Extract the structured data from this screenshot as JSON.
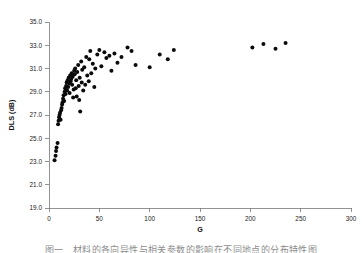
{
  "figure": {
    "caption": "图一　材料的各向异性与相关参数的影响在不同地点的分布特性图",
    "background": "#ffffff",
    "point_color": "#0b0b0b",
    "axis_color": "#777777"
  },
  "chart_data": {
    "type": "scatter",
    "title": "",
    "xlabel": "G",
    "ylabel": "DLS (dB)",
    "xlim": [
      0,
      300
    ],
    "ylim": [
      19.0,
      35.0
    ],
    "xticks": [
      0,
      50,
      100,
      150,
      200,
      250,
      300
    ],
    "xticklabels": [
      "0",
      "50",
      "100",
      "150",
      "200",
      "250",
      "300"
    ],
    "yticks": [
      19.0,
      21.0,
      23.0,
      25.0,
      27.0,
      29.0,
      31.0,
      33.0,
      35.0
    ],
    "yticklabels": [
      "19.0",
      "21.0",
      "23.0",
      "25.0",
      "27.0",
      "29.0",
      "31.0",
      "33.0",
      "35.0"
    ],
    "grid": false,
    "legend": null,
    "marker": "filled-circle",
    "marker_size": 2.0,
    "series": [
      {
        "name": "DLS vs G",
        "points": [
          [
            5.5,
            23.1
          ],
          [
            6.5,
            23.5
          ],
          [
            7.0,
            23.9
          ],
          [
            7.5,
            24.2
          ],
          [
            8.5,
            24.6
          ],
          [
            9.0,
            26.2
          ],
          [
            9.5,
            26.5
          ],
          [
            10.0,
            26.8
          ],
          [
            10.5,
            27.0
          ],
          [
            11.0,
            27.2
          ],
          [
            11.5,
            26.6
          ],
          [
            12.0,
            27.4
          ],
          [
            12.5,
            27.6
          ],
          [
            13.0,
            27.9
          ],
          [
            13.5,
            28.1
          ],
          [
            14.0,
            28.4
          ],
          [
            14.5,
            28.7
          ],
          [
            15.0,
            28.2
          ],
          [
            15.5,
            29.0
          ],
          [
            16.0,
            29.3
          ],
          [
            16.5,
            28.8
          ],
          [
            17.0,
            29.5
          ],
          [
            17.5,
            29.8
          ],
          [
            18.0,
            29.1
          ],
          [
            18.5,
            30.0
          ],
          [
            19.0,
            29.4
          ],
          [
            19.5,
            30.2
          ],
          [
            20.0,
            29.7
          ],
          [
            20.5,
            28.9
          ],
          [
            21.0,
            30.4
          ],
          [
            21.5,
            29.9
          ],
          [
            22.0,
            30.1
          ],
          [
            22.5,
            30.6
          ],
          [
            23.0,
            29.6
          ],
          [
            23.5,
            30.3
          ],
          [
            24.0,
            28.5
          ],
          [
            24.5,
            29.2
          ],
          [
            25.0,
            30.8
          ],
          [
            25.5,
            30.5
          ],
          [
            26.0,
            31.0
          ],
          [
            26.5,
            29.3
          ],
          [
            27.0,
            30.0
          ],
          [
            27.5,
            28.6
          ],
          [
            28.0,
            30.7
          ],
          [
            29.0,
            31.3
          ],
          [
            29.5,
            29.5
          ],
          [
            30.0,
            28.3
          ],
          [
            30.5,
            30.2
          ],
          [
            31.0,
            27.3
          ],
          [
            32.0,
            31.6
          ],
          [
            32.5,
            29.8
          ],
          [
            33.0,
            30.9
          ],
          [
            34.0,
            29.1
          ],
          [
            35.0,
            31.1
          ],
          [
            36.0,
            29.6
          ],
          [
            37.0,
            32.0
          ],
          [
            38.0,
            30.4
          ],
          [
            39.5,
            29.9
          ],
          [
            40.0,
            31.8
          ],
          [
            41.0,
            32.5
          ],
          [
            42.0,
            30.6
          ],
          [
            43.5,
            31.4
          ],
          [
            45.0,
            29.4
          ],
          [
            46.0,
            31.0
          ],
          [
            48.0,
            32.2
          ],
          [
            50.0,
            32.6
          ],
          [
            52.0,
            31.2
          ],
          [
            55.0,
            32.4
          ],
          [
            57.0,
            31.9
          ],
          [
            60.0,
            32.1
          ],
          [
            62.0,
            30.8
          ],
          [
            65.0,
            32.3
          ],
          [
            68.0,
            31.5
          ],
          [
            72.0,
            32.0
          ],
          [
            78.0,
            32.8
          ],
          [
            82.0,
            32.5
          ],
          [
            86.0,
            31.3
          ],
          [
            100.0,
            31.1
          ],
          [
            110.0,
            32.2
          ],
          [
            118.0,
            31.8
          ],
          [
            124.0,
            32.6
          ],
          [
            202.0,
            32.8
          ],
          [
            213.0,
            33.1
          ],
          [
            225.0,
            32.7
          ],
          [
            235.0,
            33.2
          ]
        ]
      }
    ]
  }
}
